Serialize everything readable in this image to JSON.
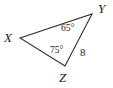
{
  "figure": {
    "kind": "triangle-diagram",
    "stroke_color": "#2b2b2b",
    "background_color": "#ffffff"
  },
  "vertices": [
    {
      "name": "X",
      "label": "X",
      "x": 20,
      "y": 38
    },
    {
      "name": "Y",
      "label": "Y",
      "x": 92,
      "y": 14
    },
    {
      "name": "Z",
      "label": "Z",
      "x": 65,
      "y": 66
    }
  ],
  "angles": [
    {
      "at_vertex": "Y",
      "label": "65°"
    },
    {
      "at_vertex": "Z",
      "label": "75°"
    }
  ],
  "sides": [
    {
      "between": "YZ",
      "label": "8"
    }
  ],
  "chart_data": {
    "type": "diagram",
    "title": "",
    "shape": "triangle",
    "vertex_labels": [
      "X",
      "Y",
      "Z"
    ],
    "vertex_points": [
      [
        20,
        38
      ],
      [
        92,
        14
      ],
      [
        65,
        66
      ]
    ],
    "edges": [
      [
        "X",
        "Y"
      ],
      [
        "Y",
        "Z"
      ],
      [
        "Z",
        "X"
      ]
    ],
    "angle_measures": [
      {
        "vertex": "Y",
        "value": 65,
        "unit": "degrees",
        "text": "65°"
      },
      {
        "vertex": "Z",
        "value": 75,
        "unit": "degrees",
        "text": "75°"
      }
    ],
    "side_measures": [
      {
        "edge": "YZ",
        "value": 8,
        "text": "8"
      }
    ],
    "grid": false,
    "legend": "none"
  }
}
